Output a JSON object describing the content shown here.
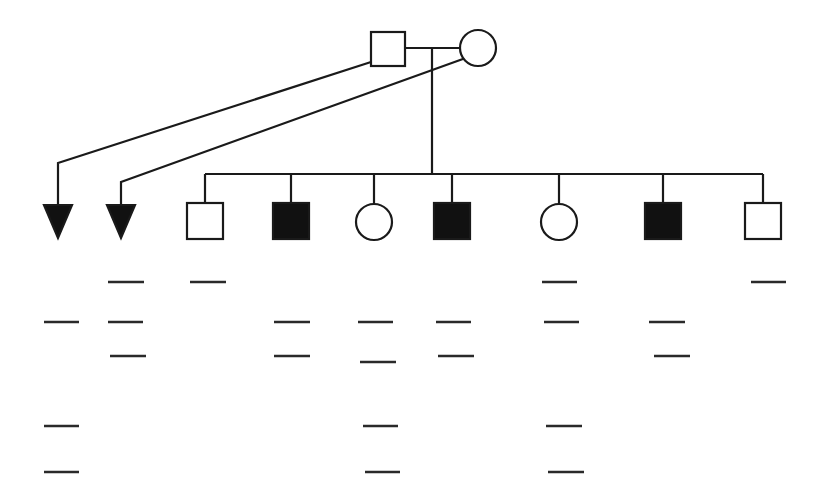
{
  "diagram": {
    "type": "pedigree",
    "colors": {
      "stroke": "#1a1a1a",
      "affected_fill": "#111111",
      "unaffected_fill": "#ffffff",
      "background": "#ffffff"
    },
    "parents": {
      "father": {
        "shape": "square",
        "affected": false,
        "x": 371,
        "y": 32,
        "size": 34
      },
      "mother": {
        "shape": "circle",
        "affected": false,
        "cx": 478,
        "cy": 48,
        "r": 18
      }
    },
    "marriage_line": {
      "x1": 405,
      "x2": 460,
      "y": 48
    },
    "descent_line": {
      "x": 432,
      "y1": 48,
      "y2": 174
    },
    "sibship_line": {
      "x1": 205,
      "x2": 763,
      "y": 174
    },
    "pregnancy_losses": [
      {
        "id": "loss-1",
        "shape": "triangle",
        "affected": true,
        "cx": 58,
        "top": 205,
        "bottom": 238,
        "half_width": 14,
        "from_parent": "father",
        "path": [
          [
            371,
            62
          ],
          [
            58,
            163
          ],
          [
            58,
            205
          ]
        ]
      },
      {
        "id": "loss-2",
        "shape": "triangle",
        "affected": true,
        "cx": 121,
        "top": 205,
        "bottom": 238,
        "half_width": 14,
        "from_parent": "mother",
        "path": [
          [
            474,
            55
          ],
          [
            121,
            182
          ],
          [
            121,
            205
          ]
        ]
      }
    ],
    "children": [
      {
        "id": "child-1",
        "shape": "square",
        "affected": false,
        "cx": 205
      },
      {
        "id": "child-2",
        "shape": "square",
        "affected": true,
        "cx": 291
      },
      {
        "id": "child-3",
        "shape": "circle",
        "affected": false,
        "cx": 374
      },
      {
        "id": "child-4",
        "shape": "square",
        "affected": true,
        "cx": 452
      },
      {
        "id": "child-5",
        "shape": "circle",
        "affected": false,
        "cx": 559
      },
      {
        "id": "child-6",
        "shape": "square",
        "affected": true,
        "cx": 663
      },
      {
        "id": "child-7",
        "shape": "square",
        "affected": false,
        "cx": 763
      }
    ],
    "child_top": 203,
    "child_size": 36,
    "bands": [
      {
        "column": "loss-1",
        "marks": [
          {
            "x1": 44,
            "x2": 79,
            "y": 322
          },
          {
            "x1": 44,
            "x2": 79,
            "y": 426
          },
          {
            "x1": 44,
            "x2": 79,
            "y": 472
          }
        ]
      },
      {
        "column": "loss-2",
        "marks": [
          {
            "x1": 108,
            "x2": 144,
            "y": 282
          },
          {
            "x1": 108,
            "x2": 143,
            "y": 322
          },
          {
            "x1": 110,
            "x2": 146,
            "y": 356
          }
        ]
      },
      {
        "column": "child-1",
        "marks": [
          {
            "x1": 190,
            "x2": 226,
            "y": 282
          }
        ]
      },
      {
        "column": "child-2",
        "marks": [
          {
            "x1": 274,
            "x2": 310,
            "y": 322
          },
          {
            "x1": 274,
            "x2": 310,
            "y": 356
          }
        ]
      },
      {
        "column": "child-3",
        "marks": [
          {
            "x1": 358,
            "x2": 393,
            "y": 322
          },
          {
            "x1": 360,
            "x2": 396,
            "y": 362
          },
          {
            "x1": 363,
            "x2": 398,
            "y": 426
          },
          {
            "x1": 365,
            "x2": 400,
            "y": 472
          }
        ]
      },
      {
        "column": "child-4",
        "marks": [
          {
            "x1": 436,
            "x2": 471,
            "y": 322
          },
          {
            "x1": 438,
            "x2": 474,
            "y": 356
          }
        ]
      },
      {
        "column": "child-5",
        "marks": [
          {
            "x1": 542,
            "x2": 577,
            "y": 282
          },
          {
            "x1": 544,
            "x2": 579,
            "y": 322
          },
          {
            "x1": 546,
            "x2": 582,
            "y": 426
          },
          {
            "x1": 548,
            "x2": 584,
            "y": 472
          }
        ]
      },
      {
        "column": "child-6",
        "marks": [
          {
            "x1": 649,
            "x2": 685,
            "y": 322
          },
          {
            "x1": 654,
            "x2": 690,
            "y": 356
          }
        ]
      },
      {
        "column": "child-7",
        "marks": [
          {
            "x1": 751,
            "x2": 786,
            "y": 282
          }
        ]
      }
    ]
  }
}
